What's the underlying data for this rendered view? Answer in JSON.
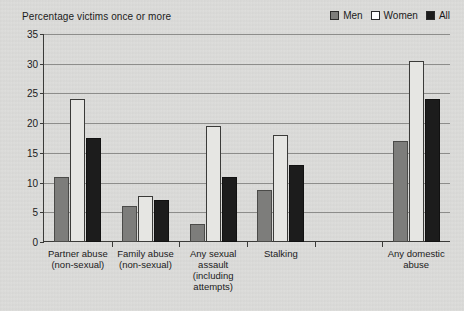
{
  "chart_data": {
    "type": "bar",
    "title": "Percentage victims once or more",
    "xlabel": "",
    "ylabel": "",
    "ylim": [
      0,
      35
    ],
    "ytick_step": 5,
    "yticks": [
      "0",
      "5",
      "10",
      "15",
      "20",
      "25",
      "30",
      "35"
    ],
    "grid": true,
    "legend_position": "top-right",
    "categories": [
      "Partner abuse\n(non-sexual)",
      "Family abuse\n(non-sexual)",
      "Any sexual\nassault\n(including\nattempts)",
      "Stalking",
      "",
      "Any domestic\nabuse"
    ],
    "series": [
      {
        "name": "Men",
        "color": "#7d7d7b",
        "values": [
          11,
          6,
          3,
          8.8,
          null,
          17
        ]
      },
      {
        "name": "Women",
        "color": "#e6e6e3",
        "values": [
          24,
          7.7,
          19.5,
          18,
          null,
          30.5
        ]
      },
      {
        "name": "All",
        "color": "#1c1c1c",
        "values": [
          17.5,
          7,
          11,
          13,
          null,
          24
        ]
      }
    ]
  },
  "legend": {
    "items": [
      {
        "label": "Men",
        "swatch": "#7d7d7b"
      },
      {
        "label": "Women",
        "swatch": "#ffffff"
      },
      {
        "label": "All",
        "swatch": "#1c1c1c"
      }
    ]
  },
  "colors": {
    "background": "#dcdcda",
    "axis": "#3a3a38",
    "grid": "#8d8d8b",
    "text": "#1b1b1b"
  }
}
